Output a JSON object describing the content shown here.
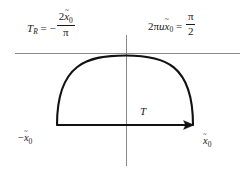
{
  "figure": {
    "background_color": "#ffffff",
    "width": 251,
    "height": 172
  },
  "equations": {
    "left": {
      "lhs_symbol": "T",
      "lhs_subscript": "R",
      "relation": "=",
      "sign": "−",
      "fraction_numerator_coefficient": "2",
      "fraction_numerator_variable": "x",
      "fraction_numerator_subscript": "0",
      "fraction_denominator": "π",
      "plain": "T_R = - 2x̃0/π"
    },
    "right": {
      "coefficient": "2",
      "pi": "π",
      "u": "u",
      "variable": "x",
      "variable_subscript": "0",
      "relation": "=",
      "fraction_numerator": "π",
      "fraction_denominator": "2",
      "plain": "2πux̃0 = π/2"
    }
  },
  "labels": {
    "left_endpoint": {
      "sign": "−",
      "variable": "x",
      "subscript": "0",
      "plain": "-x̃0"
    },
    "right_endpoint": {
      "variable": "x",
      "subscript": "0",
      "plain": "x̃0"
    },
    "contour": {
      "text": "T"
    }
  },
  "geometry": {
    "real_axis": {
      "name": "horizontal-gray-axis",
      "y": 53,
      "x_start": 15,
      "x_end": 240,
      "color": "#8a8a8a",
      "stroke_width": 1
    },
    "imaginary_axis": {
      "name": "vertical-gray-axis",
      "x": 126,
      "y_start": 35,
      "y_end": 166,
      "color": "#8a8a8a",
      "stroke_width": 1
    },
    "contour": {
      "name": "semicircular-contour",
      "color": "#111111",
      "stroke_width": 2.1,
      "left_endpoint_x": 57,
      "right_endpoint_x": 193,
      "baseline_y": 125,
      "apex_x": 126,
      "apex_y": 55,
      "direction": "counterclockwise-to-the-right",
      "arrow_at": "right-endpoint"
    }
  },
  "colors": {
    "ink": "#111111",
    "axis_gray": "#8a8a8a",
    "background": "#ffffff"
  }
}
